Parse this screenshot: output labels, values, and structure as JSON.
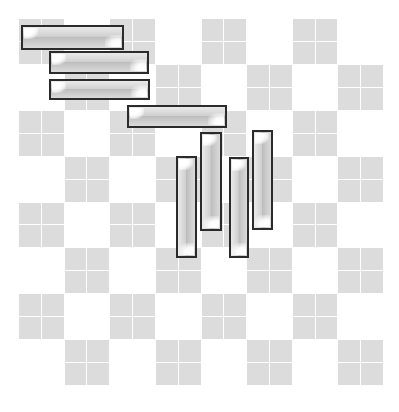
{
  "canvas": {
    "width": 399,
    "height": 412,
    "background": "#ffffff"
  },
  "grid": {
    "x": 18,
    "y": 18,
    "width": 365,
    "height": 367,
    "checker_blocks_x": 8,
    "checker_blocks_y": 8,
    "subcells_per_block": 2,
    "light_square_color": "#dcdcdc",
    "dark_square_color": "#ffffff",
    "gridline_color": "#ffffff",
    "gridline_width": 1,
    "parity_start": "on"
  },
  "bar_style": {
    "border_color": "#2b2b2b",
    "border_width": 2,
    "fill_light": "#cfcfcf",
    "fill_mid": "#c4c4c4",
    "fill_dark": "#bdbdbd",
    "highlight_color": "#ffffff"
  },
  "chart_data": {
    "type": "bar",
    "title": "",
    "subtitle": "",
    "xlabel": "",
    "ylabel": "",
    "grid": true,
    "legend": false,
    "legend_position": "none",
    "xlim": [
      0,
      365
    ],
    "ylim": [
      0,
      367
    ],
    "note": "Eight glossy 3D-style bars overlaid on a checkerboard grid; four horizontal bars form a descending staircase and four vertical bars form a cluster at the center-right.",
    "series": [
      {
        "name": "horizontal-bars",
        "orientation": "horizontal",
        "values": [
          103,
          100,
          101,
          100
        ],
        "labels": [
          "H1",
          "H2",
          "H3",
          "H4"
        ]
      },
      {
        "name": "vertical-bars",
        "orientation": "vertical",
        "values": [
          102,
          99,
          101,
          100
        ],
        "labels": [
          "V1",
          "V2",
          "V3",
          "V4"
        ]
      }
    ],
    "bars": [
      {
        "id": "H1",
        "orientation": "horizontal",
        "x": 21,
        "y": 25,
        "w": 103,
        "h": 25
      },
      {
        "id": "H2",
        "orientation": "horizontal",
        "x": 49,
        "y": 51,
        "w": 100,
        "h": 23
      },
      {
        "id": "H3",
        "orientation": "horizontal",
        "x": 49,
        "y": 79,
        "w": 101,
        "h": 21
      },
      {
        "id": "H4",
        "orientation": "horizontal",
        "x": 127,
        "y": 105,
        "w": 100,
        "h": 23
      },
      {
        "id": "V1",
        "orientation": "vertical",
        "x": 176,
        "y": 156,
        "w": 21,
        "h": 102
      },
      {
        "id": "V2",
        "orientation": "vertical",
        "x": 200,
        "y": 132,
        "w": 22,
        "h": 99
      },
      {
        "id": "V3",
        "orientation": "vertical",
        "x": 229,
        "y": 157,
        "w": 20,
        "h": 101
      },
      {
        "id": "V4",
        "orientation": "vertical",
        "x": 252,
        "y": 130,
        "w": 21,
        "h": 100
      }
    ]
  }
}
